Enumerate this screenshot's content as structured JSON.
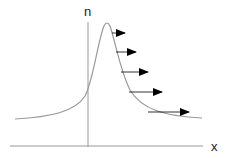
{
  "diagram": {
    "type": "peak-profile-with-flow-arrows",
    "axes": {
      "vertical_label": "n",
      "horizontal_label": "x"
    },
    "curve": {
      "shape": "asymmetric peak (sharp rise, slow decay to the right)",
      "peak_offset": "just right of vertical axis"
    },
    "arrows": {
      "count": 5,
      "direction": "right",
      "description": "horizontal arrows emanating from the decaying right flank of the peak, growing longer further down"
    },
    "colors": {
      "axis": "#999999",
      "curve": "#999999",
      "arrow": "#000000"
    }
  }
}
